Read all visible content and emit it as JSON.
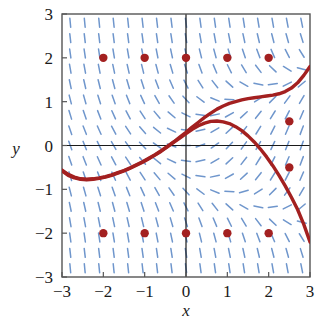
{
  "figure": {
    "title": "",
    "x_axis_label": "x",
    "y_axis_label": "y",
    "x_tick_labels": [
      "−3",
      "−2",
      "−1",
      "0",
      "1",
      "2",
      "3"
    ],
    "y_tick_labels": [
      "3",
      "2",
      "1",
      "0",
      "−1",
      "−2",
      "−3"
    ]
  },
  "colors": {
    "slope_field": "#6f96cc",
    "solution_curve": "#a32020",
    "point_fill": "#a32020",
    "axis": "#1a1a1a",
    "frame": "#555555",
    "background": "#ffffff"
  },
  "chart_data": {
    "type": "line",
    "title": "",
    "xlabel": "x",
    "ylabel": "y",
    "xlim": [
      -3,
      3
    ],
    "ylim": [
      -3,
      3
    ],
    "xticks": [
      -3,
      -2,
      -1,
      0,
      1,
      2,
      3
    ],
    "yticks": [
      -3,
      -2,
      -1,
      0,
      1,
      2,
      3
    ],
    "grid": false,
    "legend": "none",
    "slope_field": {
      "type": "direction-field",
      "formula": "dy/dx = x - y*y",
      "x_samples": [
        -2.8,
        -2.45,
        -2.1,
        -1.75,
        -1.4,
        -1.05,
        -0.7,
        -0.35,
        0,
        0.35,
        0.7,
        1.05,
        1.4,
        1.75,
        2.1,
        2.45,
        2.8
      ],
      "y_samples": [
        -2.8,
        -2.45,
        -2.1,
        -1.75,
        -1.4,
        -1.05,
        -0.7,
        -0.35,
        0,
        0.35,
        0.7,
        1.05,
        1.4,
        1.75,
        2.1,
        2.45,
        2.8
      ],
      "segment_length_px": 9,
      "color": "#6f96cc"
    },
    "series": [
      {
        "name": "upper solution curve",
        "color": "#a32020",
        "points": [
          [
            -3.0,
            -0.56
          ],
          [
            -2.85,
            -0.66
          ],
          [
            -2.7,
            -0.72
          ],
          [
            -2.55,
            -0.76
          ],
          [
            -2.4,
            -0.77
          ],
          [
            -2.25,
            -0.76
          ],
          [
            -2.1,
            -0.74
          ],
          [
            -1.95,
            -0.71
          ],
          [
            -1.8,
            -0.67
          ],
          [
            -1.65,
            -0.62
          ],
          [
            -1.5,
            -0.57
          ],
          [
            -1.35,
            -0.51
          ],
          [
            -1.2,
            -0.44
          ],
          [
            -1.05,
            -0.37
          ],
          [
            -0.9,
            -0.29
          ],
          [
            -0.75,
            -0.21
          ],
          [
            -0.6,
            -0.12
          ],
          [
            -0.45,
            -0.02
          ],
          [
            -0.3,
            0.08
          ],
          [
            -0.15,
            0.19
          ],
          [
            0.0,
            0.3
          ],
          [
            0.15,
            0.42
          ],
          [
            0.3,
            0.53
          ],
          [
            0.45,
            0.64
          ],
          [
            0.6,
            0.74
          ],
          [
            0.75,
            0.83
          ],
          [
            0.9,
            0.9
          ],
          [
            1.05,
            0.96
          ],
          [
            1.2,
            1.0
          ],
          [
            1.35,
            1.04
          ],
          [
            1.5,
            1.07
          ],
          [
            1.65,
            1.09
          ],
          [
            1.8,
            1.11
          ],
          [
            1.95,
            1.13
          ],
          [
            2.1,
            1.15
          ],
          [
            2.25,
            1.18
          ],
          [
            2.4,
            1.23
          ],
          [
            2.55,
            1.31
          ],
          [
            2.7,
            1.43
          ],
          [
            2.85,
            1.6
          ],
          [
            3.0,
            1.8
          ]
        ]
      },
      {
        "name": "lower solution curve",
        "color": "#a32020",
        "points": [
          [
            -3.0,
            -0.58
          ],
          [
            -2.85,
            -0.68
          ],
          [
            -2.7,
            -0.74
          ],
          [
            -2.55,
            -0.77
          ],
          [
            -2.4,
            -0.78
          ],
          [
            -2.25,
            -0.77
          ],
          [
            -2.1,
            -0.75
          ],
          [
            -1.95,
            -0.72
          ],
          [
            -1.8,
            -0.68
          ],
          [
            -1.65,
            -0.63
          ],
          [
            -1.5,
            -0.58
          ],
          [
            -1.35,
            -0.52
          ],
          [
            -1.2,
            -0.45
          ],
          [
            -1.05,
            -0.38
          ],
          [
            -0.9,
            -0.3
          ],
          [
            -0.75,
            -0.22
          ],
          [
            -0.6,
            -0.13
          ],
          [
            -0.45,
            -0.03
          ],
          [
            -0.3,
            0.07
          ],
          [
            -0.15,
            0.17
          ],
          [
            0.0,
            0.27
          ],
          [
            0.15,
            0.37
          ],
          [
            0.3,
            0.45
          ],
          [
            0.45,
            0.51
          ],
          [
            0.6,
            0.55
          ],
          [
            0.75,
            0.56
          ],
          [
            0.9,
            0.54
          ],
          [
            1.05,
            0.5
          ],
          [
            1.2,
            0.43
          ],
          [
            1.35,
            0.34
          ],
          [
            1.5,
            0.22
          ],
          [
            1.65,
            0.08
          ],
          [
            1.8,
            -0.08
          ],
          [
            1.95,
            -0.26
          ],
          [
            2.1,
            -0.46
          ],
          [
            2.25,
            -0.68
          ],
          [
            2.4,
            -0.92
          ],
          [
            2.55,
            -1.18
          ],
          [
            2.7,
            -1.46
          ],
          [
            2.85,
            -1.8
          ],
          [
            3.0,
            -2.2
          ]
        ]
      }
    ],
    "points": [
      {
        "x": -2,
        "y": 2
      },
      {
        "x": -1,
        "y": 2
      },
      {
        "x": 0,
        "y": 2
      },
      {
        "x": 1,
        "y": 2
      },
      {
        "x": 2,
        "y": 2
      },
      {
        "x": 2.5,
        "y": 0.55
      },
      {
        "x": 2.5,
        "y": -0.5
      },
      {
        "x": -2,
        "y": -2
      },
      {
        "x": -1,
        "y": -2
      },
      {
        "x": 0,
        "y": -2
      },
      {
        "x": 1,
        "y": -2
      },
      {
        "x": 2,
        "y": -2
      }
    ]
  }
}
